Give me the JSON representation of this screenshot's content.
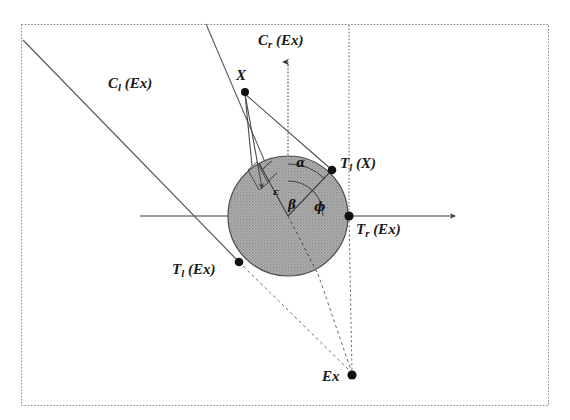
{
  "figure": {
    "kind": "geometric-diagram",
    "background_color": "#ffffff",
    "border_color": "#777777",
    "line_color": "#4a4a4a",
    "disk_fill_color": "#a8a8a8",
    "point_color": "#111111",
    "frame": {
      "x": 21,
      "y": 24,
      "width": 528,
      "height": 382
    },
    "disk": {
      "cx": 288,
      "cy": 216,
      "r": 60,
      "label": "obstacle-disk"
    },
    "labels": {
      "c_left": {
        "base": "C",
        "sub": "l",
        "arg": "(Ex)",
        "x": 108,
        "y": 76
      },
      "c_right": {
        "base": "C",
        "sub": "r",
        "arg": "(Ex)",
        "x": 258,
        "y": 33
      },
      "t_left_x": {
        "base": "T",
        "sub": "l",
        "arg": "(X)",
        "x": 340,
        "y": 156
      },
      "t_left_ex": {
        "base": "T",
        "sub": "l",
        "arg": "(Ex)",
        "x": 172,
        "y": 262
      },
      "t_right_ex": {
        "base": "T",
        "sub": "r",
        "arg": "(Ex)",
        "x": 356,
        "y": 222
      },
      "point_x": {
        "base": "X",
        "sub": "",
        "arg": "",
        "x": 236,
        "y": 68
      },
      "point_ex": {
        "base": "Ex",
        "sub": "",
        "arg": "",
        "x": 322,
        "y": 369
      }
    },
    "angles": {
      "alpha": {
        "glyph": "α",
        "x": 296,
        "y": 157,
        "size": 12
      },
      "epsilon": {
        "glyph": "ε",
        "x": 273,
        "y": 187,
        "size": 10
      },
      "beta": {
        "glyph": "β",
        "x": 288,
        "y": 199,
        "size": 12
      },
      "phi": {
        "glyph": "ϕ",
        "x": 314,
        "y": 201,
        "size": 12
      }
    },
    "points": [
      {
        "name": "point-x",
        "x": 245,
        "y": 92
      },
      {
        "name": "tangent-point-tl-x",
        "x": 332,
        "y": 170
      },
      {
        "name": "tangent-point-tr-ex",
        "x": 349,
        "y": 216
      },
      {
        "name": "tangent-point-tl-ex",
        "x": 239,
        "y": 262
      },
      {
        "name": "point-ex",
        "x": 352,
        "y": 375
      },
      {
        "name": "disk-center",
        "x": 288,
        "y": 216
      }
    ]
  }
}
